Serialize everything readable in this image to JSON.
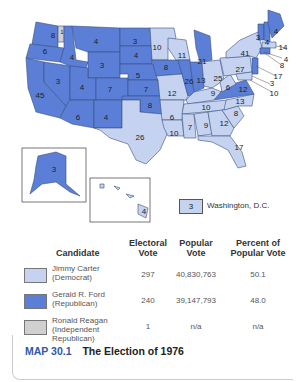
{
  "map": {
    "colors": {
      "democrat": "#c5d3f0",
      "republican": "#5b7fd6",
      "independent": "#d0d0d0",
      "border": "#3a4f80"
    },
    "state_labels": [
      {
        "state": "WA",
        "votes": "8",
        "party": "R"
      },
      {
        "state": "WA-faithless",
        "votes": "1",
        "party": "I"
      },
      {
        "state": "OR",
        "votes": "6",
        "party": "R"
      },
      {
        "state": "CA",
        "votes": "45",
        "party": "R"
      },
      {
        "state": "NV",
        "votes": "3",
        "party": "R"
      },
      {
        "state": "ID",
        "votes": "4",
        "party": "R"
      },
      {
        "state": "MT",
        "votes": "4",
        "party": "R"
      },
      {
        "state": "WY",
        "votes": "3",
        "party": "R"
      },
      {
        "state": "UT",
        "votes": "4",
        "party": "R"
      },
      {
        "state": "CO",
        "votes": "7",
        "party": "R"
      },
      {
        "state": "AZ",
        "votes": "6",
        "party": "R"
      },
      {
        "state": "NM",
        "votes": "4",
        "party": "R"
      },
      {
        "state": "ND",
        "votes": "3",
        "party": "R"
      },
      {
        "state": "SD",
        "votes": "4",
        "party": "R"
      },
      {
        "state": "NE",
        "votes": "5",
        "party": "R"
      },
      {
        "state": "KS",
        "votes": "7",
        "party": "R"
      },
      {
        "state": "OK",
        "votes": "8",
        "party": "R"
      },
      {
        "state": "TX",
        "votes": "26",
        "party": "D"
      },
      {
        "state": "MN",
        "votes": "10",
        "party": "D"
      },
      {
        "state": "IA",
        "votes": "8",
        "party": "R"
      },
      {
        "state": "MO",
        "votes": "12",
        "party": "D"
      },
      {
        "state": "AR",
        "votes": "6",
        "party": "D"
      },
      {
        "state": "LA",
        "votes": "10",
        "party": "D"
      },
      {
        "state": "WI",
        "votes": "11",
        "party": "D"
      },
      {
        "state": "IL",
        "votes": "26",
        "party": "R"
      },
      {
        "state": "MI",
        "votes": "21",
        "party": "R"
      },
      {
        "state": "IN",
        "votes": "13",
        "party": "R"
      },
      {
        "state": "OH",
        "votes": "25",
        "party": "D"
      },
      {
        "state": "KY",
        "votes": "9",
        "party": "D"
      },
      {
        "state": "TN",
        "votes": "10",
        "party": "D"
      },
      {
        "state": "MS",
        "votes": "7",
        "party": "D"
      },
      {
        "state": "AL",
        "votes": "9",
        "party": "D"
      },
      {
        "state": "GA",
        "votes": "12",
        "party": "D"
      },
      {
        "state": "FL",
        "votes": "17",
        "party": "D"
      },
      {
        "state": "SC",
        "votes": "8",
        "party": "D"
      },
      {
        "state": "NC",
        "votes": "13",
        "party": "D"
      },
      {
        "state": "VA",
        "votes": "12",
        "party": "R"
      },
      {
        "state": "WV",
        "votes": "6",
        "party": "D"
      },
      {
        "state": "PA",
        "votes": "27",
        "party": "D"
      },
      {
        "state": "NY",
        "votes": "41",
        "party": "D"
      },
      {
        "state": "VT",
        "votes": "3",
        "party": "R"
      },
      {
        "state": "NH",
        "votes": "4",
        "party": "R"
      },
      {
        "state": "ME",
        "votes": "4",
        "party": "R"
      },
      {
        "state": "MA",
        "votes": "14",
        "party": "D"
      },
      {
        "state": "RI",
        "votes": "4",
        "party": "D"
      },
      {
        "state": "CT",
        "votes": "8",
        "party": "R"
      },
      {
        "state": "NJ",
        "votes": "17",
        "party": "R"
      },
      {
        "state": "DE",
        "votes": "3",
        "party": "D"
      },
      {
        "state": "MD",
        "votes": "10",
        "party": "D"
      },
      {
        "state": "AK",
        "votes": "3",
        "party": "R"
      },
      {
        "state": "HI",
        "votes": "4",
        "party": "D"
      }
    ],
    "dc": {
      "votes": "3",
      "label": "Washington, D.C."
    }
  },
  "legend_table": {
    "headers": {
      "candidate": "Candidate",
      "electoral_1": "Electoral",
      "electoral_2": "Vote",
      "popular_1": "Popular",
      "popular_2": "Vote",
      "percent_1": "Percent of",
      "percent_2": "Popular Vote"
    },
    "rows": [
      {
        "name": "Jimmy Carter",
        "party": "(Democrat)",
        "party2": "",
        "electoral": "297",
        "popular": "40,830,763",
        "percent": "50.1",
        "color": "#c5d3f0"
      },
      {
        "name": "Gerald R. Ford",
        "party": "(Republican)",
        "party2": "",
        "electoral": "240",
        "popular": "39,147,793",
        "percent": "48.0",
        "color": "#5b7fd6"
      },
      {
        "name": "Ronald Reagan",
        "party": "(Independent",
        "party2": "Republican)",
        "electoral": "1",
        "popular": "n/a",
        "percent": "n/a",
        "color": "#d0d0d0"
      }
    ]
  },
  "caption": {
    "number": "MAP 30.1",
    "title": "The Election of 1976"
  }
}
